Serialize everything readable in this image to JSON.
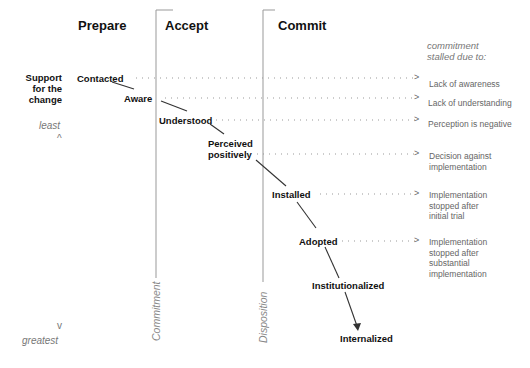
{
  "phases": [
    {
      "label": "Prepare"
    },
    {
      "label": "Accept"
    },
    {
      "label": "Commit"
    }
  ],
  "y_axis": {
    "title_lines": [
      "Support",
      "for the",
      "change"
    ],
    "top_label": "least",
    "top_glyph": "^",
    "bottom_glyph": "v",
    "bottom_label": "greatest"
  },
  "stall_header": [
    "commitment",
    "stalled due to:"
  ],
  "stages": [
    {
      "label": "Contacted"
    },
    {
      "label": "Aware"
    },
    {
      "label": "Understood"
    },
    {
      "label": "Perceived positively",
      "lines": [
        "Perceived",
        "positively"
      ]
    },
    {
      "label": "Installed"
    },
    {
      "label": "Adopted"
    },
    {
      "label": "Institutionalized"
    },
    {
      "label": "Internalized"
    }
  ],
  "stall_reasons": [
    {
      "lines": [
        "Lack of awareness"
      ]
    },
    {
      "lines": [
        "Lack of understanding"
      ]
    },
    {
      "lines": [
        "Perception is negative"
      ]
    },
    {
      "lines": [
        "Decision against",
        "implementation"
      ]
    },
    {
      "lines": [
        "Implementation",
        "stopped after",
        "initial trial"
      ]
    },
    {
      "lines": [
        "Implementation",
        "stopped after",
        "substantial",
        "implementation"
      ]
    }
  ],
  "arrow_glyph": ">",
  "threshold_labels": {
    "commitment": "Commitment",
    "disposition": "Disposition"
  },
  "colors": {
    "line": "#333333",
    "divider": "#999999",
    "dots": "#999999",
    "reason_text": "#666666"
  }
}
